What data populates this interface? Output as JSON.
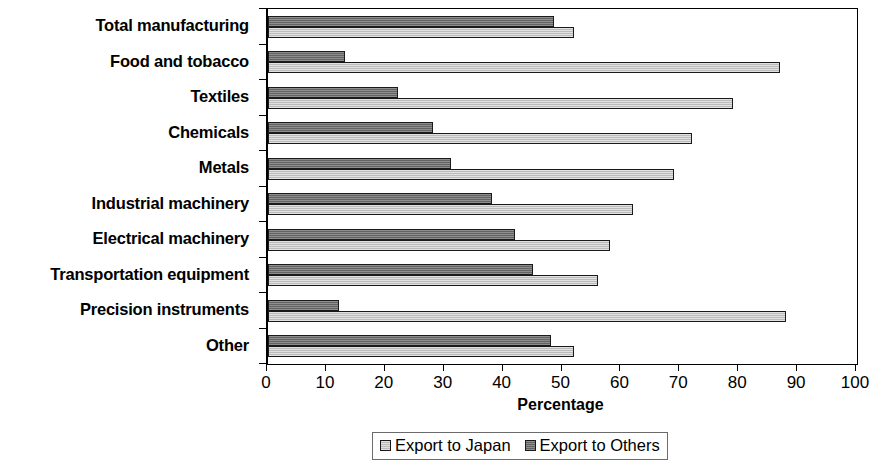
{
  "chart_data": {
    "type": "bar",
    "orientation": "horizontal",
    "title": "",
    "xlabel": "Percentage",
    "ylabel": "",
    "xlim": [
      0,
      100
    ],
    "xticks": [
      0,
      10,
      20,
      30,
      40,
      50,
      60,
      70,
      80,
      90,
      100
    ],
    "xtick_labels": [
      "0",
      "10",
      "20",
      "30",
      "40",
      "50",
      "60",
      "70",
      "80",
      "90",
      "100"
    ],
    "grid": false,
    "legend_position": "bottom",
    "categories": [
      "Total manufacturing",
      "Food and tobacco",
      "Textiles",
      "Chemicals",
      "Metals",
      "Industrial machinery",
      "Electrical machinery",
      "Transportation equipment",
      "Precision instruments",
      "Other"
    ],
    "series": [
      {
        "name": "Export to Japan",
        "color": "#c9c9c9",
        "values": [
          52,
          87,
          79,
          72,
          69,
          62,
          58,
          56,
          88,
          52
        ]
      },
      {
        "name": "Export to Others",
        "color": "#6e6e6e",
        "values": [
          48.5,
          13,
          22,
          28,
          31,
          38,
          42,
          45,
          12,
          48
        ]
      }
    ]
  },
  "legend": {
    "entries": [
      {
        "label": "Export to Japan",
        "swatch": "japan"
      },
      {
        "label": "Export to Others",
        "swatch": "others"
      }
    ]
  }
}
